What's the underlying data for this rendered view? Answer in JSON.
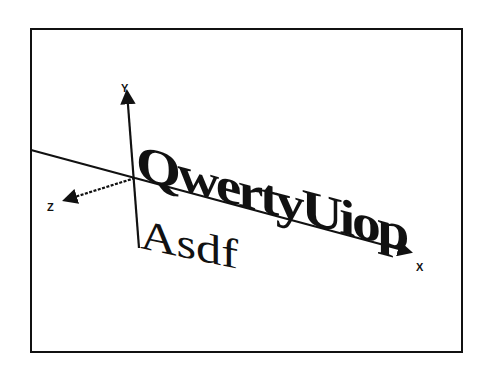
{
  "figure": {
    "axes": {
      "x_label": "X",
      "y_label": "Y",
      "z_label": "Z"
    },
    "text_objects": {
      "primary": "QwertyUiop",
      "secondary": "Asdf"
    },
    "colors": {
      "ink": "#111111",
      "background": "#ffffff"
    }
  }
}
